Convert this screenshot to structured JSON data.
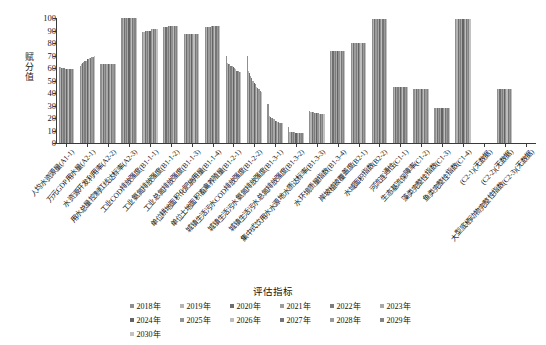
{
  "chart_data": {
    "type": "bar",
    "title": "",
    "xlabel": "评估指标",
    "ylabel": "赋分值",
    "ylim": [
      0,
      100
    ],
    "yticks": [
      0,
      10,
      20,
      30,
      40,
      50,
      60,
      70,
      80,
      90,
      100
    ],
    "grid": false,
    "legend_position": "bottom",
    "legend_title": "",
    "categories": [
      "人均水资源量(A1-1)",
      "万元GDP用水量(A2-1)",
      "水资源开发利用率(A2-2)",
      "用水总量控制红线达标率(A2-3)",
      "工业COD排放强度(B1-1-1)",
      "工业氨氮排放强度(B1-1-2)",
      "工业总氮排放强度(B1-1-3)",
      "单位耕地面积化肥施用量(B1-1-4)",
      "单位土地面积畜禽养殖量(B1-2-1)",
      "城镇生活污水COD排放强度(B1-2-2)",
      "城镇生活污水氨氮排放强度(B1-3-1)",
      "城镇生活污水总氮排放强度(B1-3-2)",
      "集中式饮用水水源地水质达标率(B1-3-3)",
      "水环境质量指数(B1-3-4)",
      "岸坡植被覆盖度(B2-1)",
      "水域面积指数(B2-2)",
      "河流连通性(C1-1)",
      "生态基流保障率(C1-2)",
      "藻类完整性指数(C1-3)",
      "鱼类完整性指数(C1-4)",
      "(C2-1)(无数据)",
      "(C2-2)(无数据)",
      "大型底栖动物完整性指数(C2-3)(无数据)"
    ],
    "series": [
      {
        "name": "2018年",
        "values": [
          61,
          62,
          63,
          100,
          89,
          93,
          87,
          93,
          70,
          70,
          31,
          13,
          26,
          74,
          80,
          99,
          45,
          43,
          28,
          99,
          null,
          43,
          null
        ]
      },
      {
        "name": "2019年",
        "values": [
          61,
          63,
          63,
          100,
          89,
          93,
          87,
          93,
          64,
          58,
          22,
          9,
          25,
          74,
          80,
          99,
          45,
          43,
          28,
          99,
          null,
          43,
          null
        ]
      },
      {
        "name": "2020年",
        "values": [
          60,
          64,
          63,
          100,
          90,
          93,
          87,
          93,
          63,
          56,
          21,
          9,
          25,
          74,
          80,
          99,
          45,
          43,
          28,
          99,
          null,
          43,
          null
        ]
      },
      {
        "name": "2021年",
        "values": [
          60,
          65,
          63,
          100,
          90,
          93,
          87,
          93,
          63,
          54,
          20,
          9,
          25,
          74,
          80,
          99,
          45,
          43,
          28,
          99,
          null,
          43,
          null
        ]
      },
      {
        "name": "2022年",
        "values": [
          60,
          66,
          63,
          100,
          90,
          94,
          87,
          93,
          62,
          52,
          20,
          9,
          24,
          74,
          80,
          99,
          45,
          43,
          28,
          99,
          null,
          43,
          null
        ]
      },
      {
        "name": "2023年",
        "values": [
          59,
          66,
          63,
          100,
          90,
          94,
          87,
          94,
          62,
          50,
          19,
          9,
          24,
          74,
          80,
          99,
          45,
          43,
          28,
          99,
          null,
          43,
          null
        ]
      },
      {
        "name": "2024年",
        "values": [
          59,
          67,
          63,
          100,
          90,
          94,
          87,
          94,
          61,
          48,
          18,
          8,
          24,
          74,
          80,
          99,
          45,
          43,
          28,
          99,
          null,
          43,
          null
        ]
      },
      {
        "name": "2025年",
        "values": [
          59,
          67,
          63,
          100,
          91,
          94,
          87,
          94,
          60,
          47,
          18,
          8,
          24,
          74,
          80,
          99,
          45,
          43,
          28,
          99,
          null,
          43,
          null
        ]
      },
      {
        "name": "2026年",
        "values": [
          59,
          68,
          63,
          100,
          91,
          94,
          87,
          94,
          59,
          45,
          17,
          8,
          23,
          74,
          80,
          99,
          45,
          43,
          28,
          99,
          null,
          43,
          null
        ]
      },
      {
        "name": "2027年",
        "values": [
          59,
          68,
          63,
          100,
          91,
          94,
          87,
          94,
          58,
          44,
          17,
          8,
          23,
          74,
          80,
          99,
          45,
          43,
          28,
          99,
          null,
          43,
          null
        ]
      },
      {
        "name": "2028年",
        "values": [
          59,
          69,
          63,
          100,
          91,
          94,
          87,
          94,
          58,
          43,
          16,
          8,
          23,
          74,
          80,
          99,
          45,
          43,
          28,
          99,
          null,
          43,
          null
        ]
      },
      {
        "name": "2029年",
        "values": [
          59,
          69,
          63,
          100,
          91,
          94,
          87,
          94,
          57,
          42,
          16,
          8,
          23,
          74,
          80,
          99,
          45,
          43,
          28,
          99,
          null,
          43,
          null
        ]
      },
      {
        "name": "2030年",
        "values": [
          59,
          70,
          63,
          100,
          91,
          94,
          87,
          94,
          57,
          41,
          16,
          8,
          23,
          74,
          80,
          99,
          45,
          43,
          28,
          99,
          null,
          43,
          null
        ]
      }
    ],
    "series_colors": [
      "#8f8f8f",
      "#b4b4b4",
      "#6e6e6e",
      "#9c9c9c",
      "#7d7d7d",
      "#a8a8a8",
      "#636363",
      "#929292",
      "#bdbdbd",
      "#757575",
      "#9a9a9a",
      "#848484",
      "#c2c2c2"
    ]
  }
}
